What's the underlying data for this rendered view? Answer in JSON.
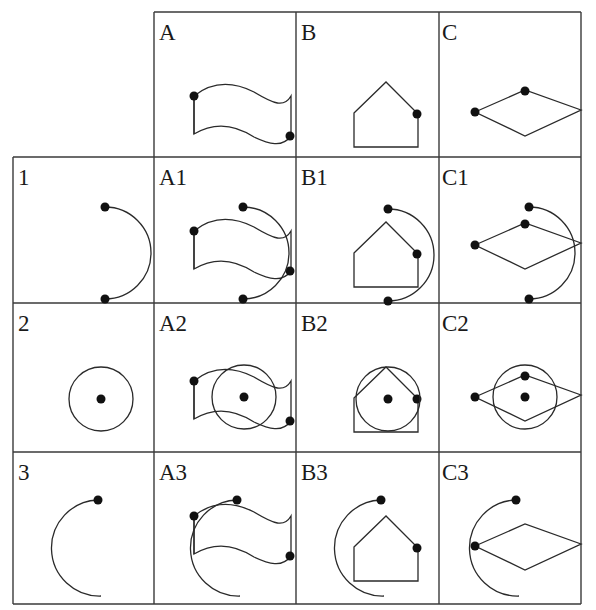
{
  "diagram": {
    "columns": [
      "A",
      "B",
      "C"
    ],
    "rows": [
      "1",
      "2",
      "3"
    ],
    "cells": {
      "A": {
        "label": "A",
        "shape": "wavy flag",
        "dots": 2
      },
      "B": {
        "label": "B",
        "shape": "house pentagon",
        "dots": 1
      },
      "C": {
        "label": "C",
        "shape": "rhombus",
        "dots": 2
      },
      "1": {
        "label": "1",
        "shape": "right-facing semicircle arc",
        "dots": 2
      },
      "2": {
        "label": "2",
        "shape": "circle with center dot",
        "dots": 1
      },
      "3": {
        "label": "3",
        "shape": "left-facing arc",
        "dots": 1
      },
      "A1": {
        "label": "A1",
        "combination": [
          "A",
          "1"
        ]
      },
      "B1": {
        "label": "B1",
        "combination": [
          "B",
          "1"
        ]
      },
      "C1": {
        "label": "C1",
        "combination": [
          "C",
          "1"
        ]
      },
      "A2": {
        "label": "A2",
        "combination": [
          "A",
          "2"
        ]
      },
      "B2": {
        "label": "B2",
        "combination": [
          "B",
          "2"
        ]
      },
      "C2": {
        "label": "C2",
        "combination": [
          "C",
          "2"
        ]
      },
      "A3": {
        "label": "A3",
        "combination": [
          "A",
          "3"
        ]
      },
      "B3": {
        "label": "B3",
        "combination": [
          "B",
          "3"
        ]
      },
      "C3": {
        "label": "C3",
        "combination": [
          "C",
          "3"
        ]
      }
    },
    "colors": {
      "line": "#2a2a2a",
      "dot": "#111111",
      "background": "#ffffff"
    }
  }
}
